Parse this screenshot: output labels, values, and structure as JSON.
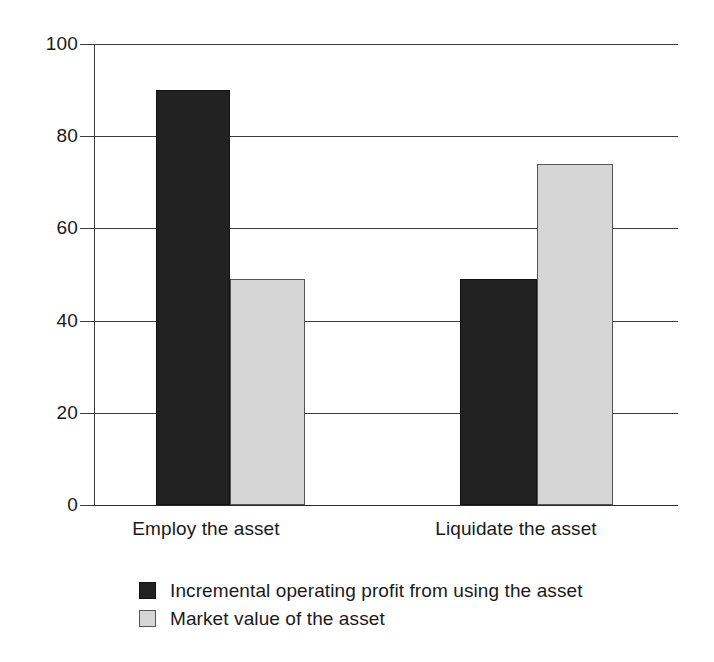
{
  "chart_data": {
    "type": "bar",
    "title": "",
    "subtitle": "",
    "xlabel": "",
    "ylabel": "",
    "categories": [
      "Employ the asset",
      "Liquidate the asset"
    ],
    "series": [
      {
        "name": "Incremental operating profit from using the asset",
        "color": "#222222",
        "values": [
          90,
          49
        ]
      },
      {
        "name": "Market value of the asset",
        "color": "#d6d6d6",
        "values": [
          49,
          74
        ]
      }
    ],
    "ylim": [
      0,
      100
    ],
    "yticks": [
      0,
      20,
      40,
      60,
      80,
      100
    ],
    "ytick_labels": [
      "0",
      "20",
      "40",
      "60",
      "80",
      "100"
    ],
    "grid": true,
    "grid_axis": "y",
    "legend_position": "bottom-left",
    "annotations": []
  },
  "axis": {
    "y_tick_labels": [
      "100",
      "80",
      "60",
      "40",
      "20",
      "0"
    ]
  },
  "legend": {
    "items": [
      {
        "label": "Incremental operating profit from using the asset",
        "swatch": "dark"
      },
      {
        "label": "Market value of the asset",
        "swatch": "light"
      }
    ]
  }
}
